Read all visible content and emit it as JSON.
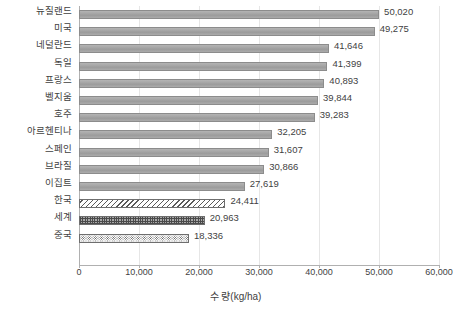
{
  "chart_data": {
    "type": "bar",
    "orientation": "horizontal",
    "title": "",
    "xlabel": "수 량(kg/ha)",
    "ylabel": "",
    "xlim": [
      0,
      60000
    ],
    "xticks": [
      "0",
      "10,000",
      "20,000",
      "30,000",
      "40,000",
      "50,000",
      "60,000"
    ],
    "xtick_values": [
      0,
      10000,
      20000,
      30000,
      40000,
      50000,
      60000
    ],
    "grid": true,
    "grid_axis": "x",
    "legend": "none",
    "categories": [
      "뉴질랜드",
      "미국",
      "네덜란드",
      "독일",
      "프랑스",
      "벨지움",
      "호주",
      "아르헨티나",
      "스페인",
      "브라질",
      "이집트",
      "한국",
      "세계",
      "중국"
    ],
    "values": [
      50020,
      49275,
      41646,
      41399,
      40893,
      39844,
      39283,
      32205,
      31607,
      30866,
      27619,
      24411,
      20963,
      18336
    ],
    "value_labels": [
      "50,020",
      "49,275",
      "41,646",
      "41,399",
      "40,893",
      "39,844",
      "39,283",
      "32,205",
      "31,607",
      "30,866",
      "27,619",
      "24,411",
      "20,963",
      "18,336"
    ],
    "bar_patterns": [
      "solid",
      "solid",
      "solid",
      "solid",
      "solid",
      "solid",
      "solid",
      "solid",
      "solid",
      "solid",
      "solid",
      "hatch-diag",
      "hatch-grid",
      "stipple"
    ],
    "colors": {
      "bar_fill": "#a6a6a6",
      "bar_border": "#8c8c8c",
      "pattern_fill": "#ffffff",
      "pattern_line": "#4a4a4a",
      "gridline": "#e6e6e6",
      "axis": "#b0b0b0",
      "text": "#3f3f3f",
      "background": "#ffffff"
    }
  }
}
